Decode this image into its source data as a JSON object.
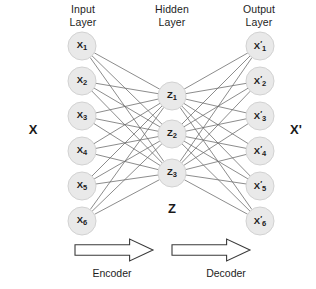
{
  "diagram": {
    "title_input": "Input\nLayer",
    "title_hidden": "Hidden\nLayer",
    "title_output": "Output\nLayer",
    "side_label_left": "X",
    "side_label_right": "X'",
    "latent_label": "Z",
    "encoder_label": "Encoder",
    "decoder_label": "Decoder",
    "colors": {
      "background": "#ffffff",
      "node_fill": "#e9e9e9",
      "node_stroke": "#d2d2d2",
      "edge": "#6e6e6e",
      "text": "#1a1a1a",
      "arrow_stroke": "#3a3a3a",
      "arrow_fill": "#ffffff"
    },
    "layers": [
      {
        "name": "input",
        "node_count": 6,
        "nodes": [
          {
            "label": "X",
            "sub": "1",
            "prime": false,
            "cx": 82,
            "cy": 46
          },
          {
            "label": "X",
            "sub": "2",
            "prime": false,
            "cx": 82,
            "cy": 81
          },
          {
            "label": "X",
            "sub": "3",
            "prime": false,
            "cx": 82,
            "cy": 116
          },
          {
            "label": "X",
            "sub": "4",
            "prime": false,
            "cx": 82,
            "cy": 151
          },
          {
            "label": "X",
            "sub": "5",
            "prime": false,
            "cx": 82,
            "cy": 186
          },
          {
            "label": "X",
            "sub": "6",
            "prime": false,
            "cx": 82,
            "cy": 221
          }
        ]
      },
      {
        "name": "hidden",
        "node_count": 3,
        "nodes": [
          {
            "label": "Z",
            "sub": "1",
            "prime": false,
            "cx": 172,
            "cy": 96
          },
          {
            "label": "Z",
            "sub": "2",
            "prime": false,
            "cx": 172,
            "cy": 134
          },
          {
            "label": "Z",
            "sub": "3",
            "prime": false,
            "cx": 172,
            "cy": 173
          }
        ]
      },
      {
        "name": "output",
        "node_count": 6,
        "nodes": [
          {
            "label": "X",
            "sub": "1",
            "prime": true,
            "cx": 260,
            "cy": 46
          },
          {
            "label": "X",
            "sub": "2",
            "prime": true,
            "cx": 260,
            "cy": 81
          },
          {
            "label": "X",
            "sub": "3",
            "prime": true,
            "cx": 260,
            "cy": 116
          },
          {
            "label": "X",
            "sub": "4",
            "prime": true,
            "cx": 260,
            "cy": 151
          },
          {
            "label": "X",
            "sub": "5",
            "prime": true,
            "cx": 260,
            "cy": 186
          },
          {
            "label": "X",
            "sub": "6",
            "prime": true,
            "cx": 260,
            "cy": 221
          }
        ]
      }
    ],
    "node_radius": 14,
    "connections": {
      "encoder_fully_connected": true,
      "decoder_fully_connected": true
    },
    "arrows": [
      {
        "name": "encoder-arrow",
        "x": 75,
        "y": 239,
        "width": 78,
        "height": 22
      },
      {
        "name": "decoder-arrow",
        "x": 172,
        "y": 239,
        "width": 78,
        "height": 22
      }
    ]
  }
}
